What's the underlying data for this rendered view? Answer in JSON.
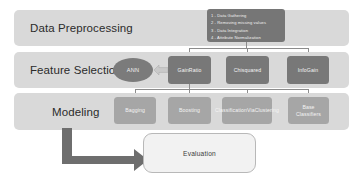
{
  "stages": [
    {
      "id": "preprocessing",
      "label": "Data Preprocessing"
    },
    {
      "id": "feature_selection",
      "label": "Feature Selection"
    },
    {
      "id": "modeling",
      "label": "Modeling"
    }
  ],
  "preprocessing_steps": [
    "1 - Data Gathering",
    "2 - Removing missing values",
    "3 - Data Integration",
    "4 - Attribute Normalization"
  ],
  "feature_selection": {
    "ann_label": "ANN",
    "arrow_icon": "block-arrow-left-icon",
    "methods": [
      {
        "id": "gainratio",
        "label": "GainRatio"
      },
      {
        "id": "chisquared",
        "label": "Chisquared"
      },
      {
        "id": "infogain",
        "label": "InfoGain"
      }
    ]
  },
  "modeling": {
    "models": [
      {
        "id": "bagging",
        "label": "Bagging"
      },
      {
        "id": "boosting",
        "label": "Boosting"
      },
      {
        "id": "classification_via_clustering",
        "label": "ClassificationViaClustering"
      },
      {
        "id": "base_classifiers",
        "label": "Base Classifiers"
      }
    ]
  },
  "evaluation": {
    "label": "Evaluation",
    "arrow_icon": "elbow-arrow-right-icon"
  },
  "colors": {
    "band": "#d9d9d9",
    "node_dark": "#787878",
    "node_light": "#a6a6a6",
    "steps_box": "#767676",
    "connector": "#8c8c8c",
    "evaluation_fill": "#f2f2f2",
    "arrow": "#6e6e6e",
    "text_on_dark": "#f2f2f2",
    "text_on_light": "#2b2b2b"
  }
}
